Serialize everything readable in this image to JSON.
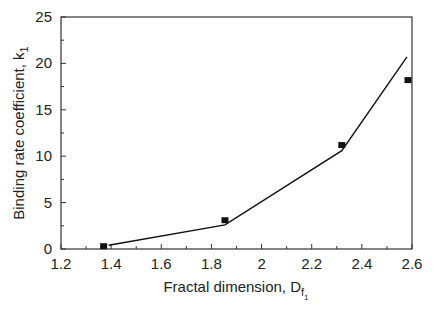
{
  "chart_data": {
    "type": "line",
    "title": "",
    "xlabel": "Fractal dimension, D",
    "xlabel_sub": "f",
    "xlabel_subsub": "1",
    "ylabel": "Binding rate coefficient, k",
    "ylabel_sub": "1",
    "xlim": [
      1.2,
      2.6
    ],
    "ylim": [
      0,
      25
    ],
    "x_ticks": [
      1.2,
      1.4,
      1.6,
      1.8,
      2,
      2.2,
      2.4,
      2.6
    ],
    "x_tick_labels": [
      "1.2",
      "1.4",
      "1.6",
      "1.8",
      "2",
      "2.2",
      "2.4",
      "2.6"
    ],
    "y_ticks": [
      0,
      5,
      10,
      15,
      20,
      25
    ],
    "y_tick_labels": [
      "0",
      "5",
      "10",
      "15",
      "20",
      "25"
    ],
    "grid": false,
    "legend": null,
    "series": [
      {
        "name": "Experimental",
        "type": "scatter",
        "marker": "square",
        "x": [
          1.37,
          1.854,
          2.32,
          2.584
        ],
        "y": [
          0.3,
          3.1,
          11.2,
          18.2
        ]
      },
      {
        "name": "Model fit",
        "type": "line",
        "x": [
          1.39,
          1.854,
          2.32,
          2.58
        ],
        "y": [
          0.4,
          2.6,
          10.6,
          20.7
        ]
      }
    ]
  }
}
